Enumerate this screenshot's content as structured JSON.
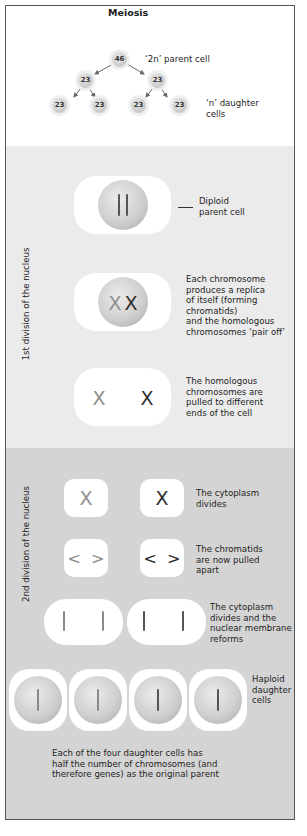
{
  "title": "Meiosis",
  "overview": {
    "parent_node": "46",
    "middle_nodes": [
      "23",
      "23"
    ],
    "daughter_nodes": [
      "23",
      "23",
      "23",
      "23"
    ],
    "parent_label": "‘2n’ parent cell",
    "daughter_label_line1": "‘n’ daughter",
    "daughter_label_line2": "cells"
  },
  "sections": {
    "first_division_label": "1st division of the nucleus",
    "second_division_label": "2nd division of the nucleus"
  },
  "first_division": {
    "step1": {
      "lines": [
        "Diploid",
        "parent cell"
      ],
      "chromosomes": "||"
    },
    "step2": {
      "lines": [
        "Each chromosome",
        "produces a replica",
        "of itself (forming",
        "chromatids)",
        "and the homologous",
        "chromosomes ‘pair off’"
      ],
      "chromosomes": "XX"
    },
    "step3": {
      "lines": [
        "The homologous",
        "chromosomes are",
        "pulled to different",
        "ends of the cell"
      ],
      "chromosomes": [
        "X",
        "X"
      ]
    }
  },
  "second_division": {
    "step1": {
      "lines": [
        "The cytoplasm",
        "divides"
      ],
      "glyphs": [
        "X",
        "X"
      ]
    },
    "step2": {
      "lines": [
        "The chromatids",
        "are now pulled",
        "apart"
      ],
      "glyphs": [
        "<  >",
        "<  >"
      ]
    },
    "step3": {
      "lines": [
        "The cytoplasm",
        "divides and the",
        "nuclear membrane",
        "reforms"
      ]
    },
    "step4": {
      "lines": [
        "Haploid",
        "daughter",
        "cells"
      ]
    }
  },
  "summary": {
    "lines": [
      "Each of the four daughter cells has",
      "half the number of chromosomes (and",
      "therefore genes) as the original parent"
    ]
  },
  "colors": {
    "frame_border": "#555555",
    "first_division_bg": "#ebebeb",
    "second_division_bg": "#d4d4d4",
    "cell_fill": "#ffffff",
    "nucleus": "#c8c8c8"
  }
}
